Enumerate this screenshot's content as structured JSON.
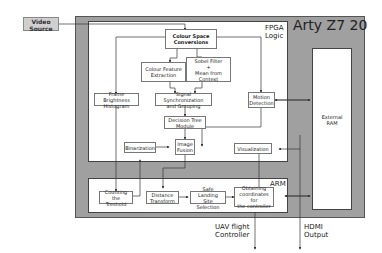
{
  "title": "Arty Z7 20",
  "source": {
    "label_line1": "Video",
    "label_line2": "Source"
  },
  "regions": {
    "fpga": {
      "label_line1": "FPGA",
      "label_line2": "Logic"
    },
    "arm": {
      "label": "ARM"
    },
    "ram": {
      "label_line1": "External",
      "label_line2": "RAM"
    }
  },
  "blocks": {
    "csc": [
      "Colour Space",
      "Conversions"
    ],
    "cfe": [
      "Colour Feature",
      "Extraction"
    ],
    "sobel": [
      "Sobel Filter",
      "+",
      "Mean from Context"
    ],
    "fbh": [
      "Frame Brightness",
      "Histogram"
    ],
    "ssg": [
      "Signal Synchronization",
      "and Grouping"
    ],
    "md": [
      "Motion",
      "Detection"
    ],
    "dtm": [
      "Decision Tree",
      "Module"
    ],
    "bin": [
      "Binarization"
    ],
    "imf": [
      "Image",
      "Fusion"
    ],
    "vis": [
      "Visualization"
    ],
    "ctt": [
      "Counting the",
      "Treshold"
    ],
    "dt": [
      "Distance",
      "Transform"
    ],
    "sls": [
      "Safe Landing",
      "Site Selection"
    ],
    "occ": [
      "Obtaining",
      "coordinates for",
      "the controller"
    ]
  },
  "outputs": {
    "uav": [
      "UAV flight",
      "Controller"
    ],
    "hdmi": [
      "HDMI",
      "Output"
    ]
  }
}
